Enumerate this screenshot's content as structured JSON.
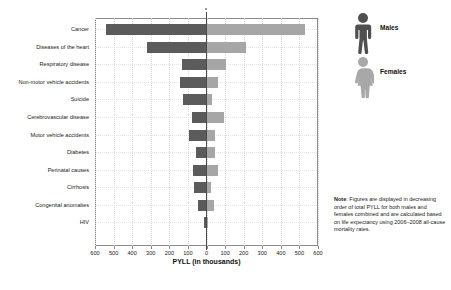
{
  "chart_data": {
    "type": "bar",
    "orientation": "horizontal-diverging",
    "title": "",
    "xlabel": "PYLL (in thousands)",
    "ylabel": "",
    "xlim": [
      -600,
      600
    ],
    "xticks": [
      600,
      500,
      400,
      300,
      200,
      100,
      0,
      100,
      200,
      300,
      400,
      500,
      600
    ],
    "grid": true,
    "legend_position": "right",
    "categories": [
      "Cancer",
      "Diseases of the heart",
      "Respiratory disease",
      "Non-motor vehicle accidents",
      "Suicide",
      "Cerebrovascular disease",
      "Motor vehicle accidents",
      "Diabetes",
      "Perinatal causes",
      "Cirrhosis",
      "Congenital anomalies",
      "HIV"
    ],
    "series": [
      {
        "name": "Males",
        "color": "#5b5b5b",
        "side": "left",
        "values": [
          540,
          320,
          130,
          145,
          125,
          80,
          95,
          55,
          75,
          65,
          45,
          12
        ]
      },
      {
        "name": "Females",
        "color": "#a6a6a6",
        "side": "right",
        "values": [
          530,
          215,
          105,
          60,
          30,
          95,
          45,
          45,
          60,
          22,
          40,
          5
        ]
      }
    ]
  },
  "axis": {
    "x_title": "PYLL (in thousands)",
    "tick_labels": [
      "600",
      "500",
      "400",
      "300",
      "200",
      "100",
      "0",
      "100",
      "200",
      "300",
      "400",
      "500",
      "600"
    ]
  },
  "legend": {
    "items": [
      {
        "label": "Males",
        "icon": "male-figure-icon",
        "color": "#5b5b5b"
      },
      {
        "label": "Females",
        "icon": "female-figure-icon",
        "color": "#a6a6a6"
      }
    ]
  },
  "note": {
    "label": "Note",
    "separator": ": ",
    "text": "Figures are displayed in decreasing order of total PYLL for both males and females combined and are calculated based on life expectancy using 2006–2008 all-cause mortality rates."
  },
  "colors": {
    "male": "#5b5b5b",
    "female": "#a6a6a6",
    "axis": "#8a8a8a",
    "center_line": "#4a4a4a",
    "grid": "#d8d8d8",
    "text": "#1a1a1a",
    "background": "#ffffff"
  }
}
